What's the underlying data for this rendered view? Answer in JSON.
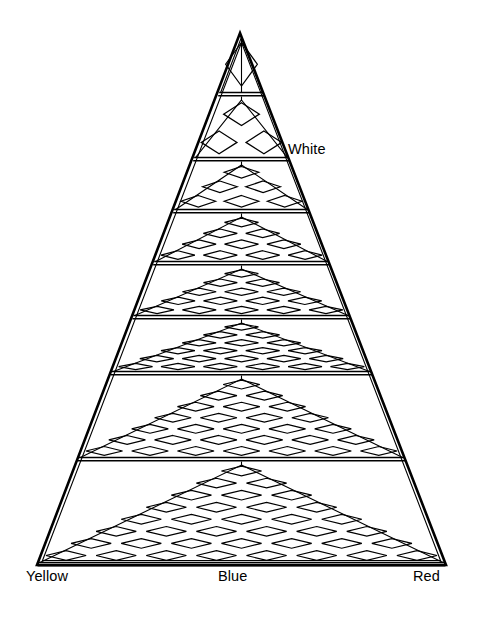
{
  "figure": {
    "type": "triangular-lattice-diagram",
    "background_color": "#ffffff",
    "stroke_color": "#000000",
    "apex": {
      "x": 240,
      "y": 33
    },
    "base_left": {
      "x": 37,
      "y": 565
    },
    "base_right": {
      "x": 446,
      "y": 565
    },
    "outer_border_width": 2.6,
    "inner_border_width": 1.1,
    "inner_border_inset": 5,
    "band_count": 8,
    "band_divider_y": [
      95,
      160,
      212,
      264,
      318,
      374,
      460,
      565
    ],
    "band_diamond_rows": [
      1,
      2,
      3,
      4,
      5,
      6,
      7,
      8
    ],
    "diamond_stroke_width": 1.2,
    "diamond_fill": "none",
    "center_axis": true
  },
  "labels": {
    "white": "White",
    "yellow": "Yellow",
    "blue": "Blue",
    "red": "Red"
  },
  "chart_data": {
    "type": "diagram",
    "xlabel": "",
    "ylabel": "",
    "corner_labels": [
      "Yellow",
      "Blue",
      "Red"
    ],
    "apex_label": "White",
    "levels": [
      {
        "level": 1,
        "diamond_rows": 1,
        "diamonds": 1
      },
      {
        "level": 2,
        "diamond_rows": 2,
        "diamonds": 3
      },
      {
        "level": 3,
        "diamond_rows": 3,
        "diamonds": 6
      },
      {
        "level": 4,
        "diamond_rows": 4,
        "diamonds": 10
      },
      {
        "level": 5,
        "diamond_rows": 5,
        "diamonds": 15
      },
      {
        "level": 6,
        "diamond_rows": 6,
        "diamonds": 21
      },
      {
        "level": 7,
        "diamond_rows": 7,
        "diamonds": 28
      },
      {
        "level": 8,
        "diamond_rows": 8,
        "diamonds": 36
      }
    ],
    "grid": false,
    "legend": "none"
  }
}
